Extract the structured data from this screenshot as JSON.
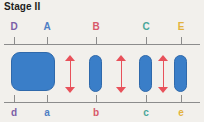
{
  "figure": {
    "title": "Stage II",
    "background_color": "#f2f0ec",
    "axis_color": "#8c8c8c",
    "blob_color": "#3a7ec8",
    "arrow_color": "#e8515a"
  },
  "top_axis": {
    "label_positions_px": [
      14,
      47,
      96,
      146,
      181
    ],
    "labels": [
      {
        "text": "D",
        "color": "#7b5ea7"
      },
      {
        "text": "A",
        "color": "#4f7fc4"
      },
      {
        "text": "B",
        "color": "#d8596a"
      },
      {
        "text": "C",
        "color": "#4aa79a"
      },
      {
        "text": "E",
        "color": "#e3b33c"
      }
    ]
  },
  "bottom_axis": {
    "label_positions_px": [
      14,
      47,
      96,
      146,
      181
    ],
    "labels": [
      {
        "text": "d",
        "color": "#7b5ea7"
      },
      {
        "text": "a",
        "color": "#4f7fc4"
      },
      {
        "text": "b",
        "color": "#d8596a"
      },
      {
        "text": "c",
        "color": "#4aa79a"
      },
      {
        "text": "e",
        "color": "#e3b33c"
      }
    ]
  },
  "blobs": [
    {
      "name": "blob-d-a",
      "x": 11,
      "y": 52,
      "width": 44,
      "height": 39,
      "radius": 9
    },
    {
      "name": "blob-b",
      "x": 89,
      "y": 55,
      "width": 13,
      "height": 37,
      "radius": 6.5
    },
    {
      "name": "blob-c",
      "x": 139,
      "y": 55,
      "width": 13,
      "height": 37,
      "radius": 6.5
    },
    {
      "name": "blob-e",
      "x": 174,
      "y": 55,
      "width": 13,
      "height": 37,
      "radius": 6.5
    }
  ],
  "arrows": [
    {
      "name": "arrow-a-b",
      "x": 70,
      "y": 55,
      "height": 38
    },
    {
      "name": "arrow-b-c",
      "x": 121,
      "y": 55,
      "height": 38
    },
    {
      "name": "arrow-c-e",
      "x": 163,
      "y": 55,
      "height": 38
    }
  ]
}
